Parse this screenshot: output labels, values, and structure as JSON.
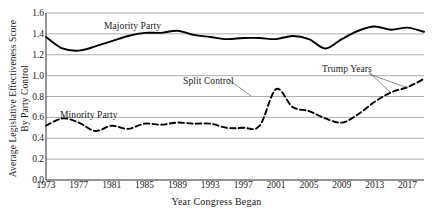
{
  "chart_data": {
    "type": "line",
    "title": "",
    "xlabel": "Year Congress Began",
    "ylabel": "Average Legislative Effectiveness Score By Party Control",
    "ylabel_line1": "Average Legislative Effectiveness Score",
    "ylabel_line2": "By Party Control",
    "xlim": [
      1973,
      2019
    ],
    "ylim": [
      0.0,
      1.6
    ],
    "grid": true,
    "legend": "none",
    "yticks": [
      "0.0",
      "0.2",
      "0.4",
      "0.6",
      "0.8",
      "1.0",
      "1.2",
      "1.4",
      "1.6"
    ],
    "ytick_values": [
      0.0,
      0.2,
      0.4,
      0.6,
      0.8,
      1.0,
      1.2,
      1.4,
      1.6
    ],
    "xticks": [
      "1973",
      "1977",
      "1981",
      "1985",
      "1989",
      "1993",
      "1997",
      "2001",
      "2005",
      "2009",
      "2013",
      "2017"
    ],
    "xtick_values": [
      1973,
      1977,
      1981,
      1985,
      1989,
      1993,
      1997,
      2001,
      2005,
      2009,
      2013,
      2017
    ],
    "x": [
      1973,
      1975,
      1977,
      1979,
      1981,
      1983,
      1985,
      1987,
      1989,
      1991,
      1993,
      1995,
      1997,
      1999,
      2001,
      2003,
      2005,
      2007,
      2009,
      2011,
      2013,
      2015,
      2017,
      2019
    ],
    "series": [
      {
        "name": "Majority Party",
        "style": "solid",
        "color": "#000000",
        "values": [
          1.37,
          1.26,
          1.24,
          1.28,
          1.33,
          1.38,
          1.41,
          1.41,
          1.43,
          1.39,
          1.37,
          1.35,
          1.36,
          1.36,
          1.35,
          1.38,
          1.35,
          1.26,
          1.35,
          1.43,
          1.47,
          1.44,
          1.46,
          1.42
        ]
      },
      {
        "name": "Minority Party / Split Control",
        "style": "dashed",
        "color": "#000000",
        "values": [
          0.52,
          0.59,
          0.55,
          0.47,
          0.52,
          0.49,
          0.54,
          0.53,
          0.55,
          0.54,
          0.54,
          0.5,
          0.5,
          0.52,
          0.87,
          0.7,
          0.66,
          0.59,
          0.55,
          0.63,
          0.75,
          0.84,
          0.89,
          0.97
        ]
      }
    ],
    "annotations": [
      {
        "text": "Majority Party",
        "x_px": 104,
        "y_px": 21,
        "pointer": false
      },
      {
        "text": "Minority Party",
        "x_px": 60,
        "y_px": 110,
        "pointer": false
      },
      {
        "text": "Split Control",
        "x_px": 183,
        "y_px": 76,
        "pointer": true
      },
      {
        "text": "Trump Years",
        "x_px": 322,
        "y_px": 64,
        "pointer": true
      }
    ],
    "series2_solid_tail_note": "solid line ends near 1.0 at right edge"
  }
}
